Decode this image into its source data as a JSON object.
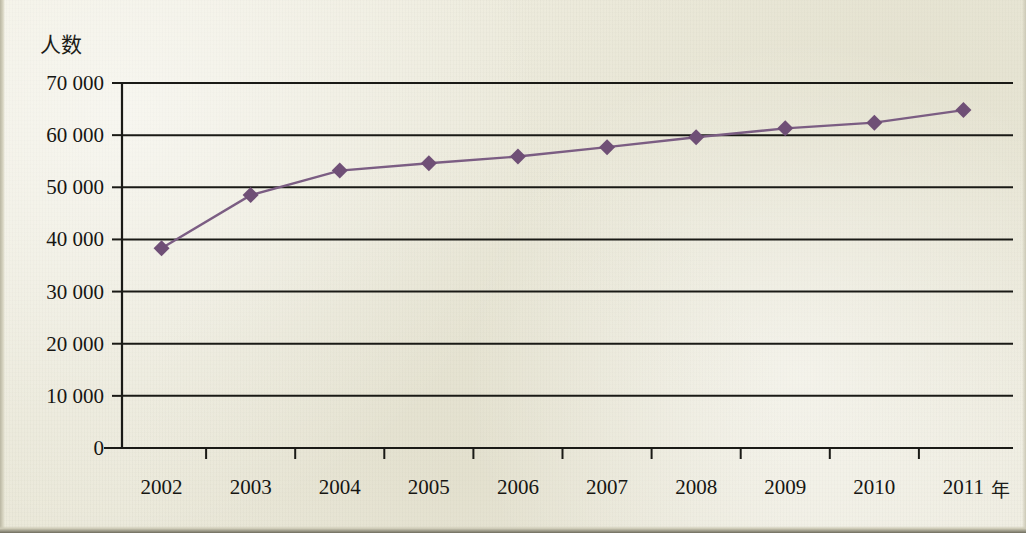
{
  "figure": {
    "y_axis_title": "人数",
    "x_axis_unit": "年",
    "marker_color": "#6f4f76",
    "line_color": "#7b5d83",
    "axis_color": "#1a1a16",
    "background_color": "#eceadc"
  },
  "chart_data": {
    "type": "line",
    "title": "",
    "xlabel": "年",
    "ylabel": "人数",
    "categories": [
      "2002",
      "2003",
      "2004",
      "2005",
      "2006",
      "2007",
      "2008",
      "2009",
      "2010",
      "2011"
    ],
    "x": [
      2002,
      2003,
      2004,
      2005,
      2006,
      2007,
      2008,
      2009,
      2010,
      2011
    ],
    "values": [
      38300,
      48500,
      53200,
      54600,
      55900,
      57700,
      59600,
      61300,
      62400,
      64800
    ],
    "series": [
      {
        "name": "人数",
        "values": [
          38300,
          48500,
          53200,
          54600,
          55900,
          57700,
          59600,
          61300,
          62400,
          64800
        ]
      }
    ],
    "ylim": [
      0,
      70000
    ],
    "ytick_values": [
      0,
      10000,
      20000,
      30000,
      40000,
      50000,
      60000,
      70000
    ],
    "ytick_labels": [
      "0",
      "10 000",
      "20 000",
      "30 000",
      "40 000",
      "50 000",
      "60 000",
      "70 000"
    ],
    "xtick_labels": [
      "2002",
      "2003",
      "2004",
      "2005",
      "2006",
      "2007",
      "2008",
      "2009",
      "2010",
      "2011"
    ],
    "grid": "horizontal",
    "legend": "none",
    "marker": "diamond"
  }
}
